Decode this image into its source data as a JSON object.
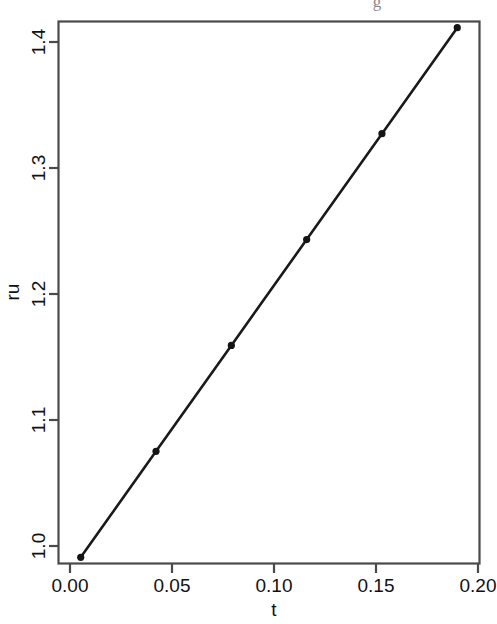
{
  "figure": {
    "background_color": "#ffffff",
    "foreground_color": "#1a1a1a",
    "axis_color": "#4a4a4a",
    "clipped_caption_fragment": "g"
  },
  "axes": {
    "x_title": "t",
    "y_title": "ru",
    "x_tick_labels": [
      "0.00",
      "0.05",
      "0.10",
      "0.15",
      "0.20"
    ],
    "y_tick_labels": [
      "1.0",
      "1.1",
      "1.2",
      "1.3",
      "1.4"
    ]
  },
  "chart_data": {
    "type": "line",
    "title": "",
    "subtitle": "",
    "xlabel": "t",
    "ylabel": "ru",
    "x": [
      0.0,
      0.04,
      0.08,
      0.12,
      0.16,
      0.2
    ],
    "values": [
      1.0,
      1.08,
      1.16,
      1.24,
      1.32,
      1.4
    ],
    "series": [
      {
        "name": "ru",
        "x": [
          0.0,
          0.04,
          0.08,
          0.12,
          0.16,
          0.2
        ],
        "values": [
          1.0,
          1.08,
          1.16,
          1.24,
          1.32,
          1.4
        ],
        "marker": "filled-circle",
        "marker_color": "#141414",
        "line_color": "#1a1a1a",
        "line_style": "solid"
      }
    ],
    "xlim": [
      -0.0118,
      0.2118
    ],
    "ylim": [
      0.9953,
      1.4047
    ],
    "xticks": [
      0.0,
      0.05,
      0.1,
      0.15,
      0.2
    ],
    "yticks": [
      1.0,
      1.1,
      1.2,
      1.3,
      1.4
    ],
    "xtick_labels": [
      "0.00",
      "0.05",
      "0.10",
      "0.15",
      "0.20"
    ],
    "ytick_labels": [
      "1.0",
      "1.1",
      "1.2",
      "1.3",
      "1.4"
    ],
    "grid": false,
    "legend": false,
    "legend_position": "none",
    "annotations": []
  }
}
